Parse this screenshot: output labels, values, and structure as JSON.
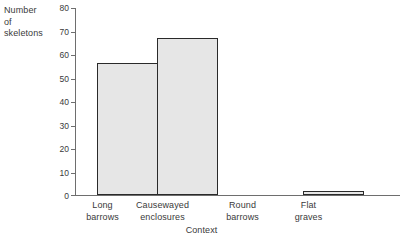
{
  "chart_data": {
    "type": "bar",
    "title": "",
    "categories": [
      "Long barrows",
      "Causewayed enclosures",
      "Round barrows",
      "Flat graves"
    ],
    "category_lines": [
      [
        "Long",
        "barrows"
      ],
      [
        "Causewayed",
        "enclosures"
      ],
      [
        "Round",
        "barrows"
      ],
      [
        "Flat",
        "graves"
      ]
    ],
    "values": [
      56,
      67,
      0,
      1.5
    ],
    "xlabel": "Context",
    "ylabel": "Number of skeletons",
    "ylabel_lines": [
      "Number",
      "of",
      "skeletons"
    ],
    "ylim": [
      0,
      80
    ],
    "yticks": [
      0,
      10,
      20,
      30,
      40,
      50,
      60,
      70,
      80
    ],
    "ytick_labels": [
      "0",
      "10",
      "20",
      "30",
      "40",
      "50",
      "60",
      "70",
      "80"
    ],
    "grid": false,
    "legend": null,
    "bar_fill_color": "#e6e6e6",
    "bar_edge_color": "#2a2a2a",
    "axis_color": "#6e6e6e",
    "text_color": "#3a3a3a",
    "background_color": "#ffffff"
  }
}
